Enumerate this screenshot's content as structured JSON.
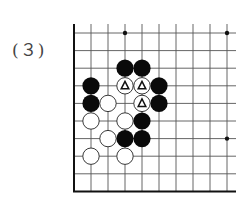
{
  "problem_label": "(３)",
  "board": {
    "x0": 74,
    "y0": 33,
    "dx": 17,
    "dy": 17.6,
    "cols": 10,
    "rows": 10,
    "right_extent": 236,
    "top_extent": 24,
    "star_points": [
      [
        3,
        0
      ],
      [
        9,
        0
      ],
      [
        9,
        6
      ]
    ],
    "black": [
      [
        3,
        2
      ],
      [
        4,
        2
      ],
      [
        1,
        3
      ],
      [
        5,
        3
      ],
      [
        1,
        4
      ],
      [
        5,
        4
      ],
      [
        4,
        5
      ],
      [
        3,
        6
      ],
      [
        4,
        6
      ]
    ],
    "white": [
      [
        2,
        4
      ],
      [
        1,
        5
      ],
      [
        3,
        5
      ],
      [
        2,
        6
      ],
      [
        1,
        7
      ],
      [
        3,
        7
      ]
    ],
    "white_marked": [
      [
        3,
        3
      ],
      [
        4,
        3
      ],
      [
        4,
        4
      ]
    ],
    "marker": "triangle"
  }
}
